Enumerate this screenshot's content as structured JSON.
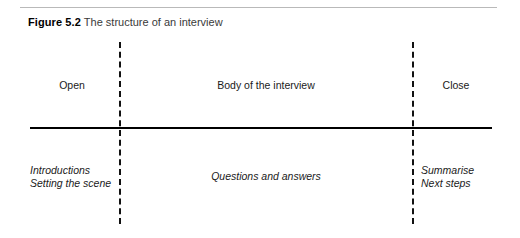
{
  "figure": {
    "caption_label": "Figure 5.2",
    "caption_text": "The structure of an interview",
    "top_rule_color": "#b9b9b9",
    "spine_color": "#000000",
    "divider_color": "#111111"
  },
  "stages": {
    "open": {
      "heading": "Open",
      "activities": [
        "Introductions",
        "Setting the scene"
      ]
    },
    "body": {
      "heading": "Body of the interview",
      "activities": [
        "Questions and answers"
      ]
    },
    "close": {
      "heading": "Close",
      "activities": [
        "Summarise",
        "Next steps"
      ]
    }
  }
}
